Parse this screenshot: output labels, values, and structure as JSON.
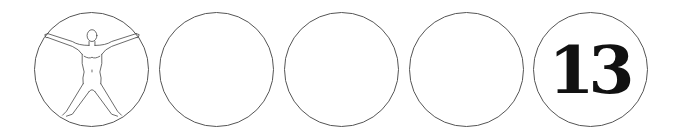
{
  "circles": [
    {
      "id": 1,
      "content": "vitruvian-figure",
      "label": ""
    },
    {
      "id": 2,
      "content": "empty",
      "label": ""
    },
    {
      "id": 3,
      "content": "empty",
      "label": ""
    },
    {
      "id": 4,
      "content": "empty",
      "label": ""
    },
    {
      "id": 5,
      "content": "number",
      "label": "13"
    }
  ],
  "colors": {
    "stroke": "#555555",
    "number": "#111111",
    "background": "#ffffff"
  }
}
